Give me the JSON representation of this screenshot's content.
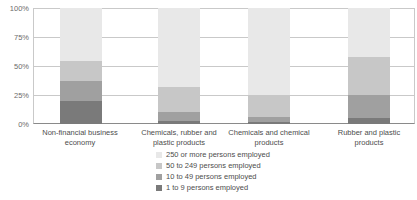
{
  "chart_data": {
    "type": "bar",
    "subtype": "stacked-percentage-column",
    "title": "",
    "subtitle": "",
    "xlabel": "",
    "ylabel": "",
    "ylim": [
      0,
      100
    ],
    "yunit": "%",
    "grid": true,
    "legend_position": "bottom-center",
    "categories": [
      "Non-financial business economy",
      "Chemicals, rubber and plastic products",
      "Chemicals and chemical products",
      "Rubber and plastic products"
    ],
    "category_lines": [
      [
        "Non-financial business",
        "economy"
      ],
      [
        "Chemicals, rubber and",
        "plastic products"
      ],
      [
        "Chemicals and chemical",
        "products"
      ],
      [
        "Rubber and plastic",
        "products"
      ]
    ],
    "ticks": [
      "100%",
      "75%",
      "50%",
      "25%",
      "0%"
    ],
    "tick_values": [
      100,
      75,
      50,
      25,
      0
    ],
    "series": [
      {
        "name": "250 or more persons employed",
        "color": "#e8e8e8",
        "values": [
          46,
          68,
          75,
          42
        ]
      },
      {
        "name": "50 to 249 persons employed",
        "color": "#c7c7c7",
        "values": [
          17,
          22,
          19,
          33
        ]
      },
      {
        "name": "10 to 49 persons employed",
        "color": "#a0a0a0",
        "values": [
          17,
          7,
          4,
          20
        ]
      },
      {
        "name": "1 to 9 persons employed",
        "color": "#7a7a7a",
        "values": [
          20,
          3,
          2,
          5
        ]
      }
    ],
    "legend_entries": [
      "250 or more persons employed",
      "50 to 249 persons employed",
      "10 to 49 persons employed",
      "1 to 9 persons employed"
    ],
    "colors": {
      "gridline": "#c9c9c9",
      "axis": "#8a8a8a",
      "tick_text": "#6b6b6b",
      "label_text": "#4d4d4d",
      "background": "#ffffff"
    }
  }
}
